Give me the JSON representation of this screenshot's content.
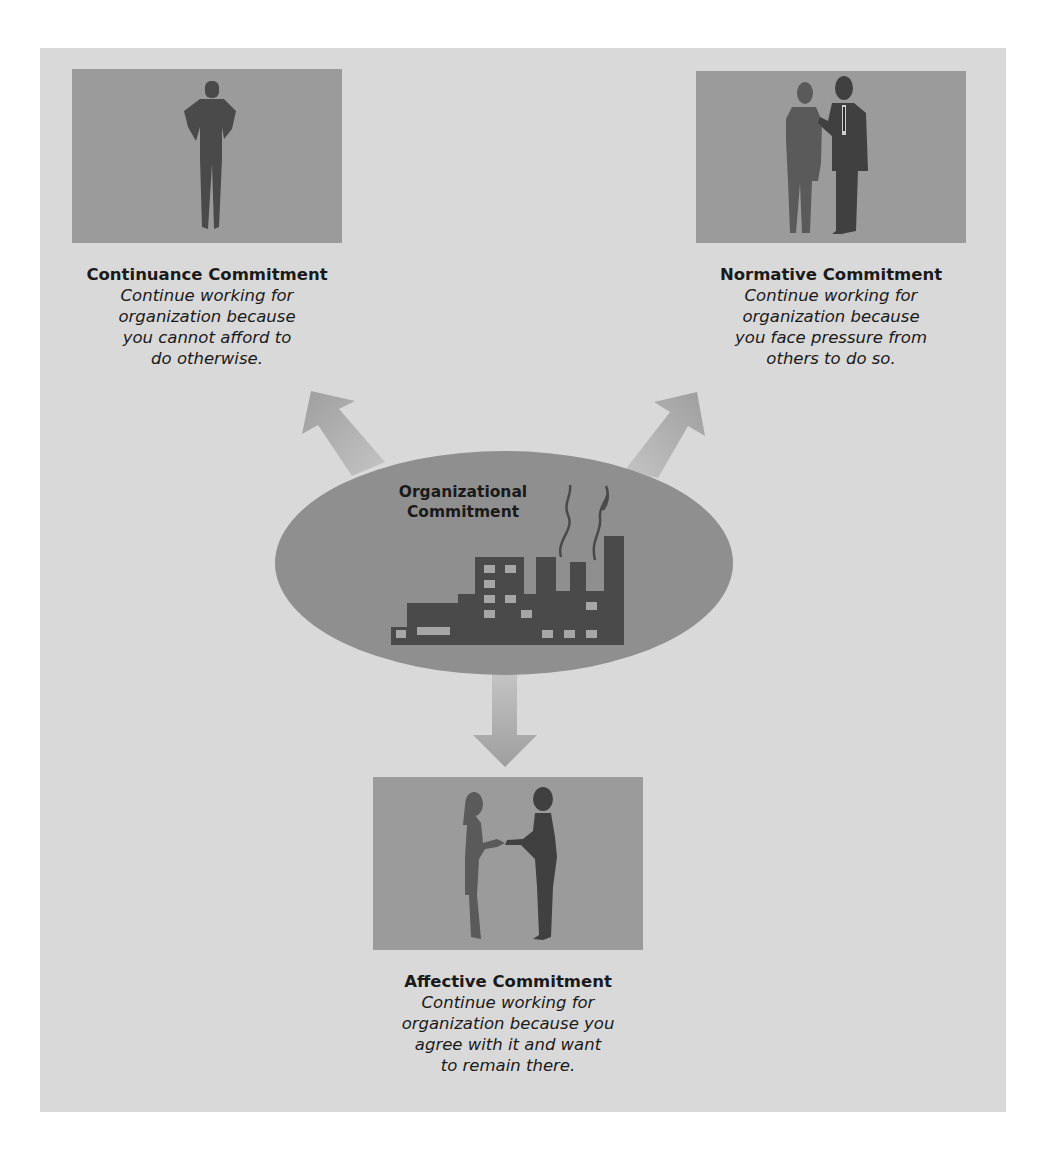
{
  "colors": {
    "panel_bg": "#d9d9d9",
    "photo_bg": "#9b9b9b",
    "silhouette": "#4a4a4a",
    "ellipse": "#8f8f8f",
    "arrow": "#a9a9a9",
    "factory": "#4a4a4a",
    "window": "#a6a6a6",
    "text": "#1a1a1a"
  },
  "center": {
    "label": "Organizational\nCommitment",
    "icon": "factory-icon"
  },
  "nodes": [
    {
      "id": "continuance",
      "title": "Continuance Commitment",
      "description": "Continue working for\norganization because\nyou cannot afford to\ndo otherwise.",
      "image": "standing-person-hands-on-hips-silhouette",
      "arrow_direction": "up-left"
    },
    {
      "id": "normative",
      "title": "Normative Commitment",
      "description": "Continue working for\norganization because\nyou face pressure from\nothers to do so.",
      "image": "man-hand-on-woman-shoulder-silhouette",
      "arrow_direction": "up-right"
    },
    {
      "id": "affective",
      "title": "Affective Commitment",
      "description": "Continue working for\norganization because you\nagree with it and want\nto remain there.",
      "image": "two-women-shaking-hands-silhouette",
      "arrow_direction": "down"
    }
  ]
}
